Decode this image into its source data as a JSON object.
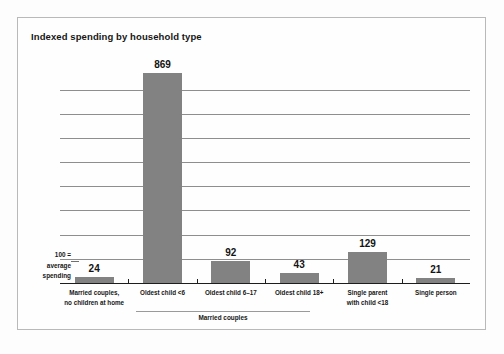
{
  "figure": {
    "title": "Indexed spending by household type",
    "axis_note": "100 =\naverage\nspending",
    "axis_note_lines": [
      "100 =",
      "average",
      "spending"
    ],
    "group_bracket_label": "Married couples",
    "bar_color": "#828282",
    "frame_color": "#b9b9b9",
    "gridline_color": "#8e8e8e",
    "baseline_color": "#1d1d1d"
  },
  "chart_data": {
    "type": "bar",
    "title": "Indexed spending by household type",
    "xlabel": "",
    "ylabel": "100 = average spending",
    "ylim": [
      0,
      900
    ],
    "grid": true,
    "gridline_values": [
      100,
      200,
      300,
      400,
      500,
      600,
      700,
      800
    ],
    "legend": "none",
    "categories": [
      "Married couples,\nno children at home",
      "Oldest child <6",
      "Oldest child 6–17",
      "Oldest child 18+",
      "Single parent\nwith child <18",
      "Single person"
    ],
    "category_lines": [
      [
        "Married couples,",
        "no children at home"
      ],
      [
        "Oldest child <6"
      ],
      [
        "Oldest child 6–17"
      ],
      [
        "Oldest child 18+"
      ],
      [
        "Single parent",
        "with child <18"
      ],
      [
        "Single person"
      ]
    ],
    "values": [
      24,
      869,
      92,
      43,
      129,
      21
    ],
    "value_labels": [
      "24",
      "869",
      "92",
      "43",
      "129",
      "21"
    ],
    "groups": [
      {
        "label": "Married couples",
        "categories": [
          "Oldest child <6",
          "Oldest child 6–17",
          "Oldest child 18+"
        ]
      }
    ]
  }
}
